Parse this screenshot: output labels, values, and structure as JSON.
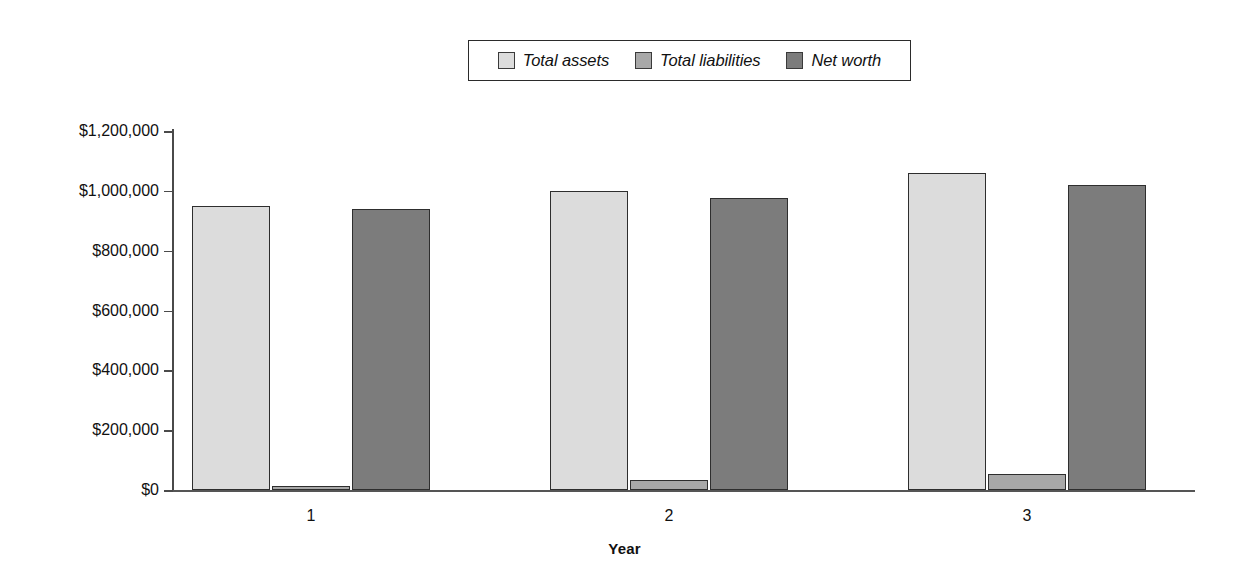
{
  "chart_data": {
    "type": "bar",
    "title": "",
    "subtitle": "",
    "xlabel": "Year",
    "ylabel": "",
    "categories": [
      "1",
      "2",
      "3"
    ],
    "series": [
      {
        "name": "Total assets",
        "color": "#dcdcdc",
        "values": [
          950000,
          1000000,
          1060000
        ]
      },
      {
        "name": "Total liabilities",
        "color": "#a8a8a8",
        "values": [
          15000,
          35000,
          55000
        ]
      },
      {
        "name": "Net worth",
        "color": "#7c7c7c",
        "values": [
          940000,
          975000,
          1020000
        ]
      }
    ],
    "ylim": [
      0,
      1200000
    ],
    "y_ticks": [
      0,
      200000,
      400000,
      600000,
      800000,
      1000000,
      1200000
    ],
    "y_tick_labels": [
      "$0",
      "$200,000",
      "$400,000",
      "$600,000",
      "$800,000",
      "$1,000,000",
      "$1,200,000"
    ],
    "grid": false,
    "legend_position": "top-center",
    "legend_border_color": "#2b2b2b",
    "axis_color": "#4a4a4a",
    "background_color": "#ffffff"
  },
  "legend": {
    "entries": [
      {
        "label": "Total assets"
      },
      {
        "label": "Total liabilities"
      },
      {
        "label": "Net worth"
      }
    ]
  },
  "axes": {
    "x": {
      "title": "Year",
      "tick_labels": [
        "1",
        "2",
        "3"
      ]
    },
    "y": {
      "tick_labels": [
        "$1,200,000",
        "$1,000,000",
        "$800,000",
        "$600,000",
        "$400,000",
        "$200,000",
        "$0"
      ]
    }
  }
}
